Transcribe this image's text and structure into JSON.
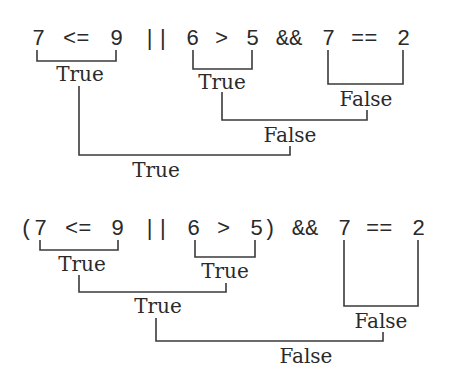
{
  "diagram": {
    "expressions": [
      {
        "id": "expr1",
        "text": "7  <=  9  ||  6  >  5  &&  7  ==  2",
        "tokens": [
          "7",
          "<=",
          "9",
          "||",
          "6",
          ">",
          "5",
          "&&",
          "7",
          "==",
          "2"
        ],
        "evaluations": [
          {
            "label": "True",
            "covers": "7 <= 9"
          },
          {
            "label": "True",
            "covers": "6 > 5"
          },
          {
            "label": "False",
            "covers": "7 == 2"
          },
          {
            "label": "False",
            "covers": "True && False"
          },
          {
            "label": "True",
            "covers": "True || False"
          }
        ]
      },
      {
        "id": "expr2",
        "text": "(7  <=  9  ||  6  >  5)  &&  7  ==  2",
        "tokens": [
          "(",
          "7",
          "<=",
          "9",
          "||",
          "6",
          ">",
          "5",
          ")",
          "&&",
          "7",
          "==",
          "2"
        ],
        "evaluations": [
          {
            "label": "True",
            "covers": "7 <= 9"
          },
          {
            "label": "True",
            "covers": "6 > 5"
          },
          {
            "label": "True",
            "covers": "True || True"
          },
          {
            "label": "False",
            "covers": "7 == 2"
          },
          {
            "label": "False",
            "covers": "True && False"
          }
        ]
      }
    ]
  }
}
